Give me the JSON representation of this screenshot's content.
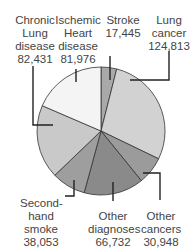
{
  "chart_data": {
    "type": "pie",
    "title": "",
    "start_angle_deg": 0,
    "direction": "clockwise",
    "center": [
      101,
      131
    ],
    "radius": 64,
    "slices": [
      {
        "label": "Stroke",
        "value": 17445,
        "color": "#a9a9a9"
      },
      {
        "label": "Lung cancer",
        "value": 124813,
        "color": "#d2d2d2"
      },
      {
        "label": "Other cancers",
        "value": 30948,
        "color": "#9b9b9b"
      },
      {
        "label": "Other diagnoses",
        "value": 66732,
        "color": "#8a8a8a"
      },
      {
        "label": "Second-hand smoke",
        "value": 38053,
        "color": "#9e9e9e"
      },
      {
        "label": "Chronic Lung disease",
        "value": 82431,
        "color": "#c9c9c9"
      },
      {
        "label": "Ischemic Heart disease",
        "value": 81976,
        "color": "#f4f4f4"
      }
    ],
    "categories": [
      "Stroke",
      "Lung cancer",
      "Other cancers",
      "Other diagnoses",
      "Second-hand smoke",
      "Chronic Lung disease",
      "Ischemic Heart disease"
    ],
    "values": [
      17445,
      124813,
      30948,
      66732,
      38053,
      82431,
      81976
    ],
    "legend": "none (callout labels)"
  },
  "labels": {
    "chronic": {
      "line1": "Chronic",
      "line2": "Lung",
      "line3": "disease",
      "value": "82,431"
    },
    "ischemic": {
      "line1": "Ischemic",
      "line2": "Heart",
      "line3": "disease",
      "value": "81,976"
    },
    "stroke": {
      "line1": "Stroke",
      "value": "17,445"
    },
    "lung_cancer": {
      "line1": "Lung",
      "line2": "cancer",
      "value": "124,813"
    },
    "second_hand": {
      "line1": "Second-",
      "line2": "hand",
      "line3": "smoke",
      "value": "38,053"
    },
    "other_diag": {
      "line1": "Other",
      "line2": "diagnoses",
      "value": "66,732"
    },
    "other_cancers": {
      "line1": "Other",
      "line2": "cancers",
      "value": "30,948"
    }
  }
}
